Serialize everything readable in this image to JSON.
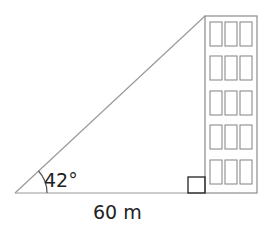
{
  "diagram": {
    "angle_label": "42°",
    "distance_label": "60 m",
    "colors": {
      "line": "#9a9a9a",
      "building": "#8c8c8c",
      "right_angle": "#222222",
      "text": "#222222",
      "background": "#ffffff"
    },
    "building": {
      "window_rows": 5,
      "window_cols": 3
    }
  }
}
